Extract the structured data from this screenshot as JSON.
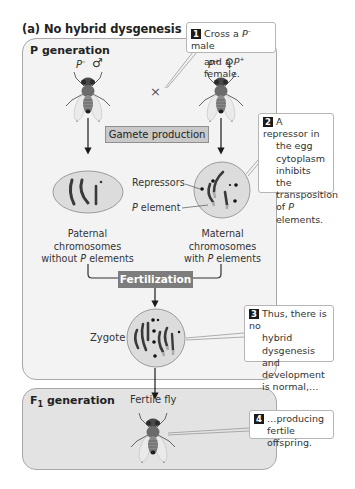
{
  "title": "(a) No hybrid dysgenesis",
  "p_generation": {
    "label": "P generation",
    "male": {
      "genotype_prefix": "P",
      "genotype_sup": "–",
      "sex_symbol": "♂"
    },
    "female": {
      "genotype_prefix": "P",
      "genotype_sup": "+",
      "sex_symbol": "♀"
    },
    "cross_symbol": "×",
    "gamete_production_label": "Gamete production",
    "repressors_label": "Repressors",
    "p_element_label": "P element",
    "paternal_caption": [
      "Paternal",
      "chromosomes",
      "without P elements"
    ],
    "maternal_caption": [
      "Maternal",
      "chromosomes",
      "with P elements"
    ],
    "fertilization_label": "Fertilization",
    "zygote_label": "Zygote"
  },
  "f1_generation": {
    "label_prefix": "F",
    "label_sub": "1",
    "label_suffix": " generation",
    "fly_label": "Fertile fly"
  },
  "callouts": [
    {
      "number": "1",
      "lines": [
        "Cross a P– male",
        "and a P+ female."
      ]
    },
    {
      "number": "2",
      "lines": [
        "A repressor in",
        "the egg",
        "cytoplasm",
        "inhibits the",
        "transposition",
        "of P elements."
      ]
    },
    {
      "number": "3",
      "lines": [
        "Thus, there is no",
        "hybrid dysgenesis",
        "and development",
        "is normal,…"
      ]
    },
    {
      "number": "4",
      "lines": [
        "…producing",
        "fertile offspring."
      ]
    }
  ],
  "colors": {
    "p_panel_fill": "#f3f3f3",
    "f1_panel_fill": "#e3e3e3",
    "gamete_box_fill": "#c9c9c9",
    "fertilization_box_fill": "#7c7c7c",
    "cell_fill": "#dcdcdc",
    "chromosome": "#3a3a3a"
  }
}
